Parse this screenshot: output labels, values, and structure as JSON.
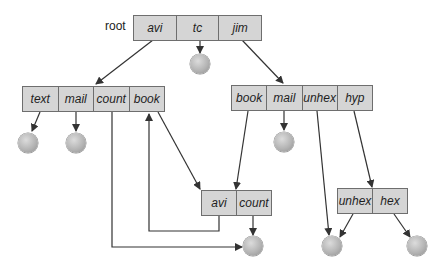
{
  "diagram": {
    "title": "",
    "root_label": "root",
    "directories": {
      "root": {
        "entries": [
          "avi",
          "tc",
          "jim"
        ]
      },
      "avi_dir": {
        "entries": [
          "text",
          "mail",
          "count",
          "book"
        ]
      },
      "jim_dir": {
        "entries": [
          "book",
          "mail",
          "unhex",
          "hyp"
        ]
      },
      "shared_book_dir": {
        "entries": [
          "avi",
          "count"
        ]
      },
      "hyp_dir": {
        "entries": [
          "unhex",
          "hex"
        ]
      }
    },
    "edges": [
      {
        "from": "root.avi",
        "to": "avi_dir"
      },
      {
        "from": "root.tc",
        "to": "file"
      },
      {
        "from": "root.jim",
        "to": "jim_dir"
      },
      {
        "from": "avi_dir.text",
        "to": "file"
      },
      {
        "from": "avi_dir.mail",
        "to": "file"
      },
      {
        "from": "avi_dir.count",
        "to": "shared_count_file"
      },
      {
        "from": "avi_dir.book",
        "to": "shared_book_dir"
      },
      {
        "from": "jim_dir.book",
        "to": "shared_book_dir"
      },
      {
        "from": "jim_dir.mail",
        "to": "file"
      },
      {
        "from": "jim_dir.unhex",
        "to": "shared_unhex_file"
      },
      {
        "from": "jim_dir.hyp",
        "to": "hyp_dir"
      },
      {
        "from": "shared_book_dir.avi",
        "to": "avi_dir.book"
      },
      {
        "from": "shared_book_dir.count",
        "to": "shared_count_file"
      },
      {
        "from": "hyp_dir.unhex",
        "to": "shared_unhex_file"
      },
      {
        "from": "hyp_dir.hex",
        "to": "file"
      }
    ],
    "colors": {
      "box_fill": "#d5d5d5",
      "box_border": "#6e6e6e",
      "arrow": "#333333",
      "node": "#b4b4b4"
    }
  }
}
